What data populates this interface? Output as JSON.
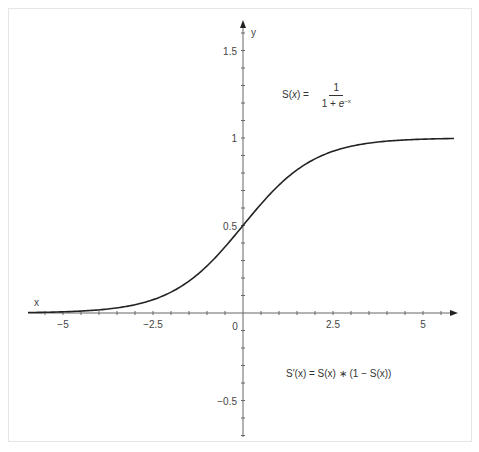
{
  "chart_data": {
    "type": "line",
    "title": "",
    "xlabel": "x",
    "ylabel": "y",
    "xlim": [
      -6,
      6
    ],
    "ylim": [
      -0.7,
      1.75
    ],
    "x_ticks": [
      -5,
      -2.5,
      0,
      2.5,
      5
    ],
    "x_tick_labels": [
      "−5",
      "−2.5",
      "0",
      "2.5",
      "5"
    ],
    "y_ticks": [
      -0.5,
      0.5,
      1,
      1.5
    ],
    "y_tick_labels": [
      "−0.5",
      "0.5",
      "1",
      "1.5"
    ],
    "minor_x_step": 0.5,
    "minor_y_step": 0.1,
    "grid": false,
    "series": [
      {
        "name": "S(x) = 1 / (1 + e^-x)",
        "function": "sigmoid",
        "x": [
          -6,
          -5,
          -4,
          -3,
          -2,
          -1,
          0,
          1,
          2,
          3,
          4,
          5,
          6
        ],
        "values": [
          0.0025,
          0.0067,
          0.018,
          0.047,
          0.119,
          0.269,
          0.5,
          0.731,
          0.881,
          0.953,
          0.982,
          0.993,
          0.9975
        ]
      }
    ],
    "annotations": [
      {
        "text": "S(x) = 1 / (1 + e^-x)",
        "x": 2.3,
        "y": 1.22
      },
      {
        "text": "S'(x) = S(x) * (1 − S(x))",
        "x": 1.5,
        "y": -0.3
      }
    ]
  },
  "labels": {
    "x_axis": "x",
    "y_axis": "y",
    "formula_lhs": "S(",
    "formula_var": "x",
    "formula_rhs": ") =",
    "formula_num": "1",
    "formula_den": "1 + ",
    "formula_den_e": "e",
    "formula_den_exp": "−x",
    "deriv": "S′(x) = S(x) ∗ (1 − S(x))"
  },
  "colors": {
    "curve": "#222222",
    "axis": "#666666",
    "frame": "#e6e6e6"
  }
}
